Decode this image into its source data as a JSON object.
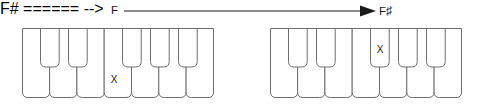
{
  "canvas": {
    "width": 486,
    "height": 111,
    "background": "#ffffff"
  },
  "annotation": {
    "from_label": "F",
    "to_label": "F",
    "to_accidental": "♯",
    "arrow": {
      "direction": "right",
      "style": "solid-line-with-filled-arrowhead"
    },
    "stroke_color": "#1a1a1a"
  },
  "keyboards": [
    {
      "id": "keyboard-left",
      "name": "before-keyboard",
      "white_key_count": 7,
      "black_key_count": 5,
      "white_key_names": [
        "C",
        "D",
        "E",
        "F",
        "G",
        "A",
        "B"
      ],
      "black_key_names": [
        "C♯",
        "D♯",
        "F♯",
        "G♯",
        "A♯"
      ],
      "marker": {
        "symbol": "X",
        "key_type": "white",
        "key_index": 3,
        "key_name": "F"
      },
      "outline_color": "#6e6e6e",
      "fill_color": "#ffffff"
    },
    {
      "id": "keyboard-right",
      "name": "after-keyboard",
      "white_key_count": 7,
      "black_key_count": 5,
      "white_key_names": [
        "C",
        "D",
        "E",
        "F",
        "G",
        "A",
        "B"
      ],
      "black_key_names": [
        "C♯",
        "D♯",
        "F♯",
        "G♯",
        "A♯"
      ],
      "marker": {
        "symbol": "X",
        "key_type": "black",
        "key_index": 2,
        "key_name": "F♯"
      },
      "outline_color": "#6e6e6e",
      "fill_color": "#ffffff"
    }
  ]
}
